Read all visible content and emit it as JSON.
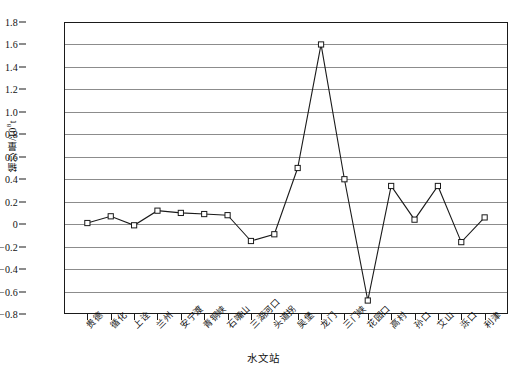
{
  "chart_data": {
    "type": "line",
    "title": "",
    "xlabel": "水文站",
    "ylabel": "输沙量/10⁸t",
    "ylabel_main": "输沙量/10",
    "ylabel_exp": "8",
    "ylabel_unit": "t",
    "ylim": [
      -0.8,
      1.8
    ],
    "ytick_step": 0.2,
    "grid": true,
    "legend": "none",
    "marker": "open-square",
    "line_color": "#1a1a1a",
    "grid_color": "#8c8c8c",
    "categories": [
      "贵德",
      "循化",
      "上诠",
      "兰州",
      "安宁渡",
      "青铜峡",
      "石嘴山",
      "三湖河口",
      "头道拐",
      "吴堡",
      "龙门",
      "三门峡",
      "花园口",
      "高村",
      "孙口",
      "艾山",
      "泺口",
      "利津"
    ],
    "values": [
      0.01,
      0.07,
      -0.01,
      0.12,
      0.1,
      0.09,
      0.08,
      -0.15,
      -0.09,
      0.5,
      1.6,
      0.4,
      -0.68,
      0.34,
      0.04,
      0.34,
      -0.16,
      0.06
    ],
    "yticks": [
      "1.8",
      "1.6",
      "1.4",
      "1.2",
      "1.0",
      "0.8",
      "0.6",
      "0.4",
      "0.2",
      "0",
      "−0.2",
      "−0.4",
      "−0.6",
      "−0.8"
    ],
    "ytick_values": [
      1.8,
      1.6,
      1.4,
      1.2,
      1.0,
      0.8,
      0.6,
      0.4,
      0.2,
      0,
      -0.2,
      -0.4,
      -0.6,
      -0.8
    ]
  }
}
